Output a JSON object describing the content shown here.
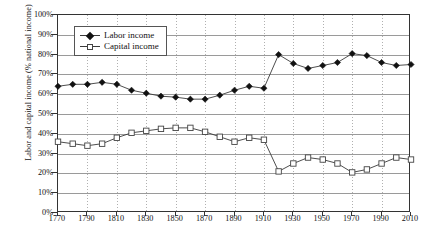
{
  "chart_data": {
    "type": "line",
    "title": "",
    "xlabel": "",
    "ylabel": "Labor and capital income (% national income)",
    "xlim": [
      1770,
      2010
    ],
    "ylim": [
      0,
      100
    ],
    "grid": true,
    "legend_position": "top-left",
    "x": [
      1770,
      1780,
      1790,
      1800,
      1810,
      1820,
      1830,
      1840,
      1850,
      1860,
      1870,
      1880,
      1890,
      1900,
      1910,
      1920,
      1930,
      1940,
      1950,
      1960,
      1970,
      1980,
      1990,
      2000,
      2010
    ],
    "xticks": [
      "1770",
      "1790",
      "1810",
      "1830",
      "1850",
      "1870",
      "1890",
      "1910",
      "1930",
      "1950",
      "1970",
      "1990",
      "2010"
    ],
    "yticks": [
      "0%",
      "10%",
      "20%",
      "30%",
      "40%",
      "50%",
      "60%",
      "70%",
      "80%",
      "90%",
      "100%"
    ],
    "series": [
      {
        "name": "Labor income",
        "marker": "filled-diamond",
        "values": [
          64,
          65,
          65,
          66,
          65,
          62,
          60.5,
          59,
          58.5,
          57.5,
          57.5,
          59.5,
          62,
          64,
          63,
          80,
          75.5,
          73,
          74.5,
          76,
          80.5,
          79.5,
          76,
          74.5,
          75
        ]
      },
      {
        "name": "Capital income",
        "marker": "open-square",
        "values": [
          36,
          35,
          34,
          35,
          38,
          40.5,
          41.5,
          42.5,
          43,
          43,
          41,
          38.5,
          36,
          38,
          37,
          21,
          25,
          28,
          27,
          25,
          20.5,
          22,
          25,
          28,
          27
        ]
      }
    ]
  },
  "legend": {
    "items": [
      {
        "label": "Labor income",
        "marker": "filled-diamond-icon"
      },
      {
        "label": "Capital income",
        "marker": "open-square-icon"
      }
    ]
  },
  "colors": {
    "line": "#3a3a3a",
    "labor_marker": "#111111",
    "capital_marker": "#ffffff",
    "grid": "#9a9a9a",
    "frame": "#333333",
    "background": "#ffffff"
  }
}
